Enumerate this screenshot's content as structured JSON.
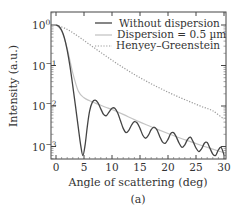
{
  "chart_data": {
    "type": "line",
    "title": "",
    "caption": "(a)",
    "xlabel": "Angle of scattering (deg)",
    "ylabel": "Intensity (a.u.)",
    "xlim": [
      -1,
      31
    ],
    "ylim": [
      0.0005,
      2.1
    ],
    "yscale": "log",
    "grid": false,
    "legend_position": "upper right",
    "x_ticks": [
      0,
      5,
      10,
      15,
      20,
      25,
      30
    ],
    "x_tick_labels": [
      "0",
      "5",
      "10",
      "15",
      "20",
      "25",
      "30"
    ],
    "y_ticks": [
      1,
      0.1,
      0.01,
      0.001
    ],
    "y_tick_labels": [
      {
        "base": "10",
        "exp": "0"
      },
      {
        "base": "10",
        "exp": "−1"
      },
      {
        "base": "10",
        "exp": "−2"
      },
      {
        "base": "10",
        "exp": "−3"
      }
    ],
    "series": [
      {
        "name": "Without dispersion",
        "style": "solid",
        "color": "#444444",
        "x": [
          0,
          0.5,
          1,
          1.5,
          2,
          2.5,
          3,
          3.5,
          4,
          4.4,
          4.8,
          5.2,
          5.6,
          6,
          6.5,
          7,
          7.5,
          8,
          8.5,
          9,
          9.5,
          10,
          10.5,
          11,
          11.5,
          12,
          12.5,
          13,
          13.5,
          14,
          14.5,
          15,
          15.5,
          16,
          16.5,
          17,
          17.5,
          18,
          18.5,
          19,
          19.5,
          20,
          20.5,
          21,
          21.5,
          22,
          22.5,
          23,
          23.5,
          24,
          24.5,
          25,
          25.5,
          26,
          26.5,
          27,
          27.5,
          28,
          28.5,
          29,
          29.5,
          30
        ],
        "y": [
          1.0,
          0.93,
          0.74,
          0.48,
          0.24,
          0.095,
          0.031,
          0.0095,
          0.0028,
          0.0011,
          0.0006,
          0.0011,
          0.0032,
          0.0075,
          0.0125,
          0.014,
          0.012,
          0.0085,
          0.0062,
          0.0058,
          0.0072,
          0.0088,
          0.0088,
          0.0068,
          0.0044,
          0.0028,
          0.0022,
          0.0025,
          0.0034,
          0.0041,
          0.0038,
          0.0028,
          0.0019,
          0.0016,
          0.0019,
          0.0026,
          0.003,
          0.0026,
          0.0018,
          0.0013,
          0.0012,
          0.0015,
          0.0021,
          0.0022,
          0.0017,
          0.0012,
          0.00095,
          0.0011,
          0.0015,
          0.0017,
          0.0013,
          0.00092,
          0.00075,
          0.00088,
          0.0012,
          0.00125,
          0.0009,
          0.00065,
          0.0006,
          0.00082,
          0.00095,
          0.00062
        ]
      },
      {
        "name": "Dispersion = 0.5 µm",
        "style": "solid",
        "color": "#c4c4c4",
        "x": [
          0,
          1,
          2,
          3,
          4,
          5,
          6,
          7,
          8,
          9,
          10,
          12,
          14,
          16,
          18,
          20,
          22,
          24,
          26,
          28,
          30
        ],
        "y": [
          1.0,
          0.72,
          0.26,
          0.065,
          0.023,
          0.016,
          0.0135,
          0.0118,
          0.0104,
          0.0092,
          0.0082,
          0.0062,
          0.0046,
          0.0035,
          0.0027,
          0.0021,
          0.00165,
          0.00132,
          0.00106,
          0.00086,
          0.0007
        ]
      },
      {
        "name": "Henyey–Greenstein",
        "style": "dotted",
        "color": "#999999",
        "x": [
          0,
          2,
          4,
          6,
          8,
          10,
          12,
          14,
          16,
          18,
          20,
          22,
          24,
          26,
          28,
          30
        ],
        "y": [
          1.0,
          0.78,
          0.52,
          0.33,
          0.21,
          0.135,
          0.089,
          0.06,
          0.042,
          0.03,
          0.022,
          0.0165,
          0.0126,
          0.0097,
          0.0076,
          0.0047
        ]
      }
    ]
  }
}
